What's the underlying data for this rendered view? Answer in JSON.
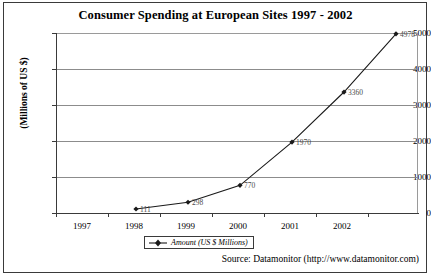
{
  "chart_data": {
    "type": "line",
    "title": "Consumer Spending at European Sites 1997 - 2002",
    "xlabel": "",
    "ylabel": "(Millions of US $)",
    "categories": [
      "1997",
      "1998",
      "1999",
      "2000",
      "2001",
      "2002"
    ],
    "x_tick_labels": [
      "1997",
      "1998",
      "1999",
      "2000",
      "2001",
      "2002"
    ],
    "y_tick_labels": [
      "0",
      "1000",
      "2000",
      "3000",
      "4000",
      "5000"
    ],
    "y_ticks": [
      0,
      1000,
      2000,
      3000,
      4000,
      5000
    ],
    "ylim": [
      0,
      5500
    ],
    "grid": "horizontal",
    "legend_position": "bottom-center",
    "series": [
      {
        "name": "Amount (US $ Millions)",
        "marker": "diamond",
        "color": "#1a1a1a",
        "values": [
          111,
          298,
          770,
          1970,
          3360,
          4978
        ],
        "point_labels": [
          "111",
          "298",
          "770",
          "1970",
          "3360",
          "4978"
        ]
      }
    ],
    "data_points": [
      {
        "year": "1998",
        "value": 111,
        "label": "111"
      },
      {
        "year": "1999",
        "value": 298,
        "label": "298"
      },
      {
        "year": "2000",
        "value": 770,
        "label": "770"
      },
      {
        "year": "2001",
        "value": 1970,
        "label": "1970"
      },
      {
        "year": "2002",
        "value": 3360,
        "label": "3360"
      },
      {
        "year": "",
        "value": 4978,
        "label": "4978"
      }
    ],
    "source": "Source: Datamonitor (http://www.datamonitor.com)"
  },
  "legend": {
    "entries": [
      {
        "label": "Amount (US $ Millions)",
        "marker": "diamond",
        "color": "#1a1a1a"
      }
    ]
  },
  "colors": {
    "series_line": "#1a1a1a",
    "gridline": "#8c8c8c",
    "axis": "#3a3a3a",
    "frame": "#3a3a3a",
    "label_text": "#4a4a4a",
    "background": "#ffffff"
  }
}
